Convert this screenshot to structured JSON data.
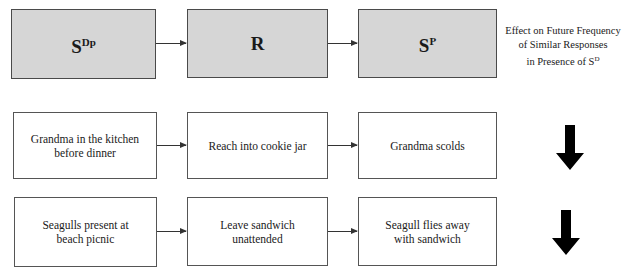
{
  "header_row": {
    "antecedent": {
      "base": "S",
      "superscript": "Dp"
    },
    "behavior": {
      "base": "R",
      "superscript": ""
    },
    "consequence": {
      "base": "S",
      "superscript": "P"
    },
    "effect_label_lines": [
      "Effect on Future Frequency",
      "of Similar Responses",
      "in Presence of S"
    ],
    "effect_label_superscript": "D",
    "header_fill": "#d6d6d6"
  },
  "examples": [
    {
      "antecedent": "Grandma in the kitchen before dinner",
      "behavior": "Reach into cookie jar",
      "consequence": "Grandma scolds",
      "effect": "decrease",
      "effect_icon": "down-arrow-icon"
    },
    {
      "antecedent": "Seagulls present at beach picnic",
      "behavior": "Leave sandwich unattended",
      "consequence": "Seagull flies away with sandwich",
      "effect": "decrease",
      "effect_icon": "down-arrow-icon"
    }
  ]
}
